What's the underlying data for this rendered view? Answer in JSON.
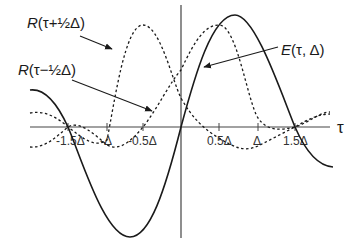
{
  "diagram": {
    "axis_label_x": "τ",
    "tick_labels": [
      "-1.5Δ",
      "-Δ",
      "-0.5Δ",
      "0.5Δ",
      "Δ",
      "1.5Δ"
    ],
    "curves": [
      {
        "name": "R(τ+½Δ)",
        "label": "R(τ+½Δ)",
        "style": "dashed",
        "peak_at": "-0.5Δ"
      },
      {
        "name": "R(τ−½Δ)",
        "label": "R(τ−½Δ)",
        "style": "dashed",
        "peak_at": "0.5Δ"
      },
      {
        "name": "E(τ, Δ)",
        "label": "E(τ, Δ)",
        "style": "solid",
        "max_near": "0.7Δ",
        "min_near": "-0.7Δ"
      }
    ],
    "labels": {
      "r_plus_prefix": "R",
      "r_plus_arg": "(τ+½Δ)",
      "r_minus_prefix": "R",
      "r_minus_arg": "(τ−½Δ)",
      "e_prefix": "E",
      "e_arg": "(τ, Δ)"
    },
    "colors": {
      "stroke": "#1a1a1a",
      "axis": "#444444",
      "background": "#ffffff"
    }
  }
}
